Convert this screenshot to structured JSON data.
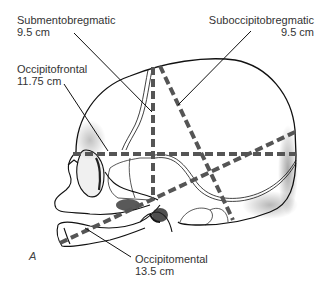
{
  "figure": {
    "panel_letter": "A"
  },
  "labels": {
    "submentobregmatic": {
      "name": "Submentobregmatic",
      "value": "9.5 cm"
    },
    "occipitofrontal": {
      "name": "Occipitofrontal",
      "value": "11.75 cm"
    },
    "suboccipitobregmatic": {
      "name": "Suboccipitobregmatic",
      "value": "9.5 cm"
    },
    "occipitomental": {
      "name": "Occipitomental",
      "value": "13.5 cm"
    }
  },
  "colors": {
    "outline": "#111111",
    "dashed_diameter": "#555555",
    "leader_line": "#111111",
    "text": "#333333"
  }
}
